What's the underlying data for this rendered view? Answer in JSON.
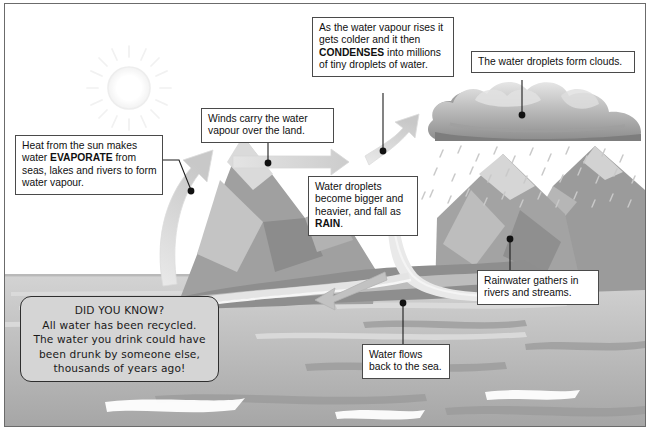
{
  "diagram": {
    "background_color": "#ffffff",
    "border_color": "#6b6b6b"
  },
  "callouts": [
    {
      "id": "evaporate",
      "name": "callout-evaporate",
      "text_before": "Heat from the sun makes water ",
      "bold": "EVAPORATE",
      "text_after": " from seas, lakes and rivers to form water vapour.",
      "full_text": "Heat from the sun makes water EVAPORATE from seas, lakes and rivers to form water vapour."
    },
    {
      "id": "winds",
      "name": "callout-winds",
      "full_text": "Winds carry the water vapour over the land."
    },
    {
      "id": "condenses",
      "name": "callout-condenses",
      "text_before": "As the water vapour rises it gets colder and it then ",
      "bold": "CONDENSES",
      "text_after": " into millions of tiny droplets of water.",
      "full_text": "As the water vapour rises it gets colder and it then CONDENSES into millions of tiny droplets of water."
    },
    {
      "id": "clouds",
      "name": "callout-clouds",
      "full_text": "The water droplets form clouds."
    },
    {
      "id": "rain",
      "name": "callout-rain",
      "text_before": "Water droplets become bigger and heavier, and fall as ",
      "bold": "RAIN",
      "text_after": ".",
      "full_text": "Water droplets become bigger and heavier, and fall as RAIN."
    },
    {
      "id": "rainwater",
      "name": "callout-rainwater",
      "full_text": "Rainwater gathers in rivers and streams."
    },
    {
      "id": "waterflows",
      "name": "callout-water-flows",
      "full_text": "Water flows back to the sea."
    }
  ],
  "fact_box": {
    "heading": "DID YOU KNOW?",
    "line1": "All water has been recycled.",
    "line2": "The water you drink could have",
    "line3": "been drunk by someone else,",
    "line4": "thousands of years ago!",
    "fill_color": "#d5d5d5",
    "border_color": "#2e2e2e"
  },
  "scene_elements": {
    "sun": "sun-icon",
    "cloud": "rain-cloud",
    "mountains": "mountain-range",
    "sea": "sea",
    "river": "river",
    "rain": "rain-drops",
    "evaporation_arrow": "evaporation-arrow",
    "wind_arrow": "wind-arrow",
    "rising-vapour-arrow": "rising-vapour-arrow",
    "river_flow_arrow": "river-flow-arrow"
  },
  "colors": {
    "sea": "#a8a8a8",
    "sea_light": "#c6c6c6",
    "mountain_dark": "#8a8a8a",
    "mountain_mid": "#a5a5a5",
    "mountain_light": "#cfcfcf",
    "cloud_dark": "#7f7f7f",
    "cloud_mid": "#b4b4b4",
    "cloud_light": "#dcdcdc",
    "arrow": "#d2d2d2",
    "sun": "#ededed",
    "leader_line": "#1d1d1d"
  }
}
